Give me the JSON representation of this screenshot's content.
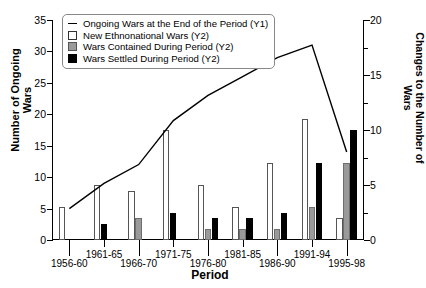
{
  "chart_data": {
    "type": "bar",
    "title": "",
    "xlabel": "Period",
    "ylabel": "Number of Ongoing Wars",
    "ylabel_right": "Changes to the Number of Wars",
    "categories": [
      "1956-60",
      "1961-65",
      "1966-70",
      "1971-75",
      "1976-80",
      "1981-85",
      "1986-90",
      "1991-94",
      "1995-98"
    ],
    "ylim": [
      0,
      35
    ],
    "yticks": [
      0,
      5,
      10,
      15,
      20,
      25,
      30,
      35
    ],
    "ylim_right": [
      0,
      20
    ],
    "yticks_right": [
      0,
      5,
      10,
      15,
      20
    ],
    "grid": false,
    "legend_position": "top-left",
    "series": [
      {
        "name": "Ongoing Wars at the End of the Period (Y1)",
        "type": "line",
        "axis": "y1",
        "color": "#000000",
        "values": [
          5,
          9,
          12,
          19,
          23,
          26,
          29,
          31,
          14
        ]
      },
      {
        "name": "New Ethnonational Wars (Y2)",
        "type": "bar",
        "axis": "y2",
        "color": "#ffffff",
        "values": [
          3,
          5,
          4.5,
          10,
          5,
          3,
          7,
          11,
          2
        ]
      },
      {
        "name": "Wars Contained During Period (Y2)",
        "type": "bar",
        "axis": "y2",
        "color": "#9a9a9a",
        "values": [
          0,
          0,
          2,
          0,
          1,
          1,
          1,
          3,
          7
        ]
      },
      {
        "name": "Wars Settled During Period (Y2)",
        "type": "bar",
        "axis": "y2",
        "color": "#000000",
        "values": [
          0,
          1.5,
          0,
          2.5,
          2,
          2,
          2.5,
          7,
          10
        ]
      }
    ]
  },
  "legend": {
    "items": [
      {
        "label": "Ongoing Wars at the End of the Period (Y1)",
        "marker": "line"
      },
      {
        "label": "New Ethnonational Wars (Y2)",
        "marker": "white-square"
      },
      {
        "label": "Wars Contained During Period (Y2)",
        "marker": "gray-square"
      },
      {
        "label": "Wars Settled During Period (Y2)",
        "marker": "black-square"
      }
    ]
  }
}
